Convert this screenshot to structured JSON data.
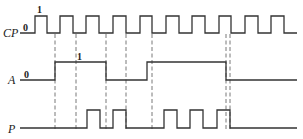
{
  "diagram": {
    "type": "timing-diagram",
    "signals": [
      {
        "name": "CP",
        "label": "CP",
        "level_labels": {
          "low": "0",
          "high": "1"
        },
        "description": "clock pulses",
        "pulse_count": 10,
        "edges": [
          [
            20,
            0
          ],
          [
            35,
            1
          ],
          [
            47,
            0
          ],
          [
            60,
            1
          ],
          [
            73,
            0
          ],
          [
            86,
            1
          ],
          [
            99,
            0
          ],
          [
            113,
            1
          ],
          [
            126,
            0
          ],
          [
            140,
            1
          ],
          [
            152,
            0
          ],
          [
            166,
            1
          ],
          [
            179,
            0
          ],
          [
            192,
            1
          ],
          [
            205,
            0
          ],
          [
            219,
            1
          ],
          [
            231,
            0
          ],
          [
            245,
            1
          ],
          [
            258,
            0
          ],
          [
            271,
            1
          ],
          [
            284,
            0
          ],
          [
            297,
            0
          ]
        ]
      },
      {
        "name": "A",
        "label": "A",
        "level_labels": {
          "low": "0",
          "high": "1"
        },
        "edges": [
          [
            20,
            0
          ],
          [
            55,
            1
          ],
          [
            106,
            0
          ],
          [
            147,
            1
          ],
          [
            226,
            0
          ],
          [
            297,
            0
          ]
        ]
      },
      {
        "name": "P",
        "label": "P",
        "edges": [
          [
            20,
            0
          ],
          [
            87,
            1
          ],
          [
            100,
            0
          ],
          [
            113,
            1
          ],
          [
            126,
            0
          ],
          [
            164,
            1
          ],
          [
            177,
            0
          ],
          [
            190,
            1
          ],
          [
            203,
            0
          ],
          [
            217,
            1
          ],
          [
            230,
            0
          ],
          [
            297,
            0
          ]
        ]
      }
    ],
    "dashed_guides": [
      55,
      76,
      106,
      126,
      152,
      226,
      230
    ]
  }
}
